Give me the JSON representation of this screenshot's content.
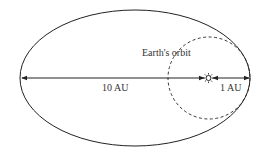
{
  "diagram": {
    "labels": {
      "earth_orbit": "Earth's orbit",
      "distance_far": "10 AU",
      "distance_near": "1 AU"
    },
    "icons": {
      "sun": "sun-icon"
    },
    "colors": {
      "stroke": "#222222",
      "text": "#333333",
      "background": "#ffffff"
    }
  }
}
